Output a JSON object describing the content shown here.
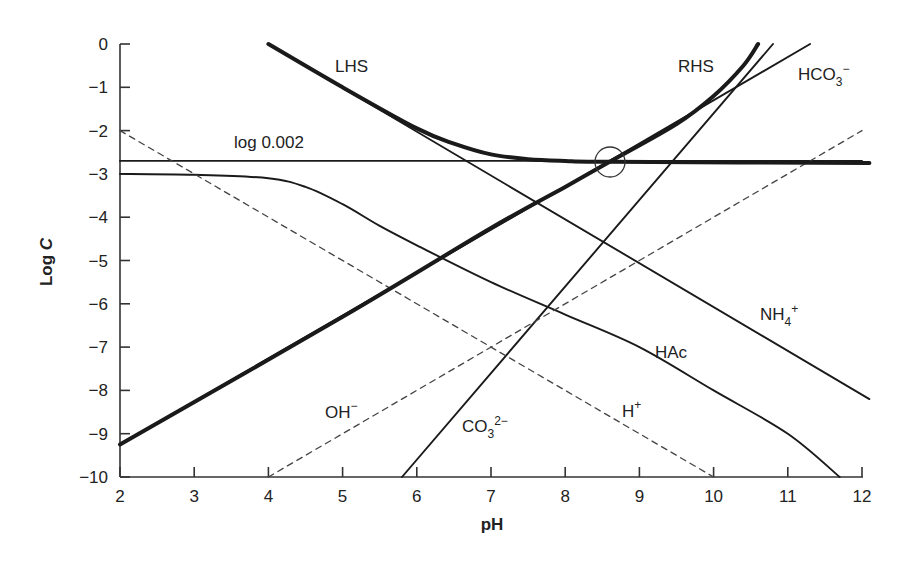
{
  "chart_data": {
    "type": "line",
    "title": "",
    "xlabel": "pH",
    "ylabel": "Log C",
    "xlim": [
      2,
      12
    ],
    "ylim": [
      -10,
      0
    ],
    "grid": false,
    "legend": "none (inline labels)",
    "x_ticks": [
      "2",
      "3",
      "4",
      "5",
      "6",
      "7",
      "8",
      "9",
      "10",
      "11",
      "12"
    ],
    "y_ticks": [
      "0",
      "−1",
      "−2",
      "−3",
      "−4",
      "−5",
      "−6",
      "−7",
      "−8",
      "−9",
      "−10"
    ],
    "series": [
      {
        "name": "log 0.002",
        "style": "solid",
        "width": "thin",
        "points": [
          [
            2,
            -2.7
          ],
          [
            12,
            -2.7
          ]
        ]
      },
      {
        "name": "HAc",
        "style": "solid",
        "width": "thin",
        "points": [
          [
            2,
            -3.0
          ],
          [
            3,
            -3.02
          ],
          [
            4,
            -3.1
          ],
          [
            4.5,
            -3.3
          ],
          [
            5,
            -3.7
          ],
          [
            5.5,
            -4.2
          ],
          [
            6,
            -4.65
          ],
          [
            7,
            -5.5
          ],
          [
            8,
            -6.25
          ],
          [
            9,
            -7.0
          ],
          [
            10,
            -8.0
          ],
          [
            11,
            -9.0
          ],
          [
            11.7,
            -10.0
          ]
        ]
      },
      {
        "name": "NH4+",
        "style": "solid",
        "width": "thin",
        "points": [
          [
            4,
            0
          ],
          [
            12.1,
            -8.2
          ]
        ]
      },
      {
        "name": "HCO3−",
        "style": "solid",
        "width": "thin",
        "points": [
          [
            2,
            -9.25
          ],
          [
            8.6,
            -2.7
          ],
          [
            11.3,
            0
          ]
        ]
      },
      {
        "name": "CO3 2−",
        "style": "solid",
        "width": "thin",
        "points": [
          [
            5.8,
            -10
          ],
          [
            10.8,
            0
          ]
        ]
      },
      {
        "name": "H+",
        "style": "dashed",
        "width": "thin",
        "points": [
          [
            2,
            -2
          ],
          [
            10,
            -10
          ]
        ]
      },
      {
        "name": "OH−",
        "style": "dashed",
        "width": "thin",
        "points": [
          [
            4,
            -10
          ],
          [
            12,
            -2
          ]
        ]
      },
      {
        "name": "LHS",
        "style": "solid",
        "width": "thick",
        "points": [
          [
            4,
            0
          ],
          [
            5,
            -1.0
          ],
          [
            6,
            -1.95
          ],
          [
            6.5,
            -2.3
          ],
          [
            7,
            -2.55
          ],
          [
            7.5,
            -2.66
          ],
          [
            8,
            -2.7
          ],
          [
            8.6,
            -2.72
          ],
          [
            12.1,
            -2.75
          ]
        ]
      },
      {
        "name": "RHS",
        "style": "solid",
        "width": "thick",
        "points": [
          [
            2,
            -9.25
          ],
          [
            5,
            -6.3
          ],
          [
            7,
            -4.25
          ],
          [
            8,
            -3.3
          ],
          [
            8.6,
            -2.72
          ],
          [
            9.5,
            -1.85
          ],
          [
            10,
            -1.2
          ],
          [
            10.4,
            -0.5
          ],
          [
            10.6,
            0
          ]
        ]
      }
    ],
    "annotations": [
      {
        "text": "LHS",
        "x": 5.2,
        "y": -0.55
      },
      {
        "text": "RHS",
        "x": 9.3,
        "y": -0.55
      },
      {
        "text": "HCO3−",
        "x": 10.9,
        "y": -0.65
      },
      {
        "text": "log 0.002",
        "x": 3.5,
        "y": -2.4
      },
      {
        "text": "NH4+",
        "x": 10.8,
        "y": -6.4
      },
      {
        "text": "HAc",
        "x": 9.0,
        "y": -7.3
      },
      {
        "text": "OH−",
        "x": 4.8,
        "y": -8.8
      },
      {
        "text": "H+",
        "x": 8.8,
        "y": -8.8
      },
      {
        "text": "CO3 2−",
        "x": 6.5,
        "y": -9.25
      },
      {
        "text": "circle marker at intersection",
        "x": 8.6,
        "y": -2.72
      }
    ]
  },
  "labels": {
    "xlabel": "pH",
    "ylabel_main": "Log ",
    "ylabel_italic": "C",
    "lhs": "LHS",
    "rhs": "RHS",
    "hco3_base": "HCO",
    "hco3_sub": "3",
    "hco3_sup": "−",
    "log002": "log 0.002",
    "nh4_base": "NH",
    "nh4_sub": "4",
    "nh4_sup": "+",
    "hac": "HAc",
    "oh_base": "OH",
    "oh_sup": "−",
    "h_base": "H",
    "h_sup": "+",
    "co3_base": "CO",
    "co3_sub": "3",
    "co3_sup": "2−"
  }
}
